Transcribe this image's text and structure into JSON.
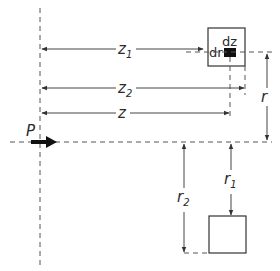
{
  "diagram": {
    "type": "geometry-schematic",
    "point": {
      "label": "P"
    },
    "dimensions": {
      "z1": {
        "base": "z",
        "subscript": "1"
      },
      "z2": {
        "base": "z",
        "subscript": "2"
      },
      "z": {
        "base": "z",
        "subscript": ""
      },
      "r": {
        "base": "r",
        "subscript": ""
      },
      "r1": {
        "base": "r",
        "subscript": "1"
      },
      "r2": {
        "base": "r",
        "subscript": "2"
      }
    },
    "element_labels": {
      "dz": "dz",
      "dr": "dr"
    },
    "colors": {
      "ink": "#2a2a2a",
      "line": "#444444",
      "dash": "#555555",
      "background": "#ffffff",
      "element_fill": "#111111"
    }
  }
}
